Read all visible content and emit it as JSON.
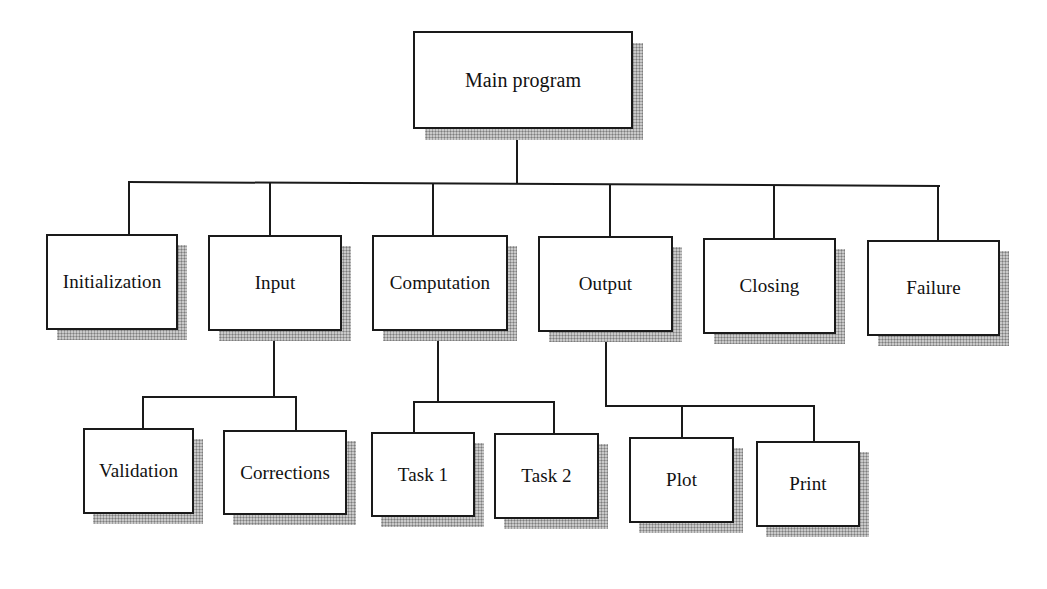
{
  "diagram": {
    "type": "hierarchy-chart",
    "root": {
      "label": "Main program",
      "children": [
        {
          "label": "Initialization",
          "children": []
        },
        {
          "label": "Input",
          "children": [
            {
              "label": "Validation"
            },
            {
              "label": "Corrections"
            }
          ]
        },
        {
          "label": "Computation",
          "children": [
            {
              "label": "Task 1"
            },
            {
              "label": "Task 2"
            }
          ]
        },
        {
          "label": "Output",
          "children": [
            {
              "label": "Plot"
            },
            {
              "label": "Print"
            }
          ]
        },
        {
          "label": "Closing",
          "children": []
        },
        {
          "label": "Failure",
          "children": []
        }
      ]
    }
  },
  "labels": {
    "main": "Main program",
    "initialization": "Initialization",
    "input": "Input",
    "computation": "Computation",
    "output": "Output",
    "closing": "Closing",
    "failure": "Failure",
    "validation": "Validation",
    "corrections": "Corrections",
    "task1": "Task 1",
    "task2": "Task 2",
    "plot": "Plot",
    "print": "Print"
  },
  "colors": {
    "line": "#1a1a1a",
    "box_fill": "#ffffff",
    "shadow": "#b9b9b9",
    "background": "#ffffff"
  }
}
